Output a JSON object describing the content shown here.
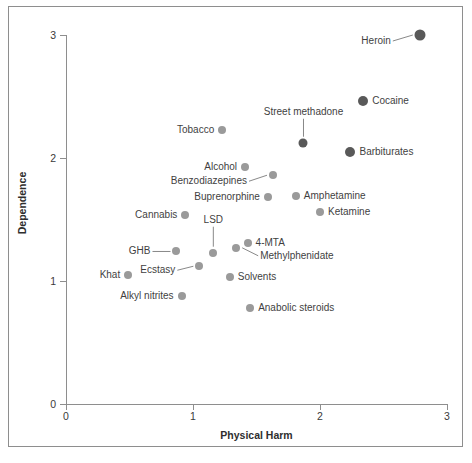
{
  "chart_data": {
    "type": "scatter",
    "title": "",
    "xlabel": "Physical Harm",
    "ylabel": "Dependence",
    "xlim": [
      0,
      3
    ],
    "ylim": [
      0,
      3
    ],
    "xticks": [
      0,
      1,
      2,
      3
    ],
    "yticks": [
      0,
      1,
      2,
      3
    ],
    "xtick_labels": [
      "0",
      "1",
      "2",
      "3"
    ],
    "ytick_labels": [
      "0",
      "1",
      "2",
      "3"
    ],
    "grid": false,
    "legend": "none",
    "colors": {
      "dark_marker": "#595959",
      "light_marker": "#9a9a9a",
      "axis": "#8e8e8e",
      "text": "#3f3f3f",
      "background": "#ffffff",
      "frame": "#8e8e8e"
    },
    "points": [
      {
        "label": "Heroin",
        "x": 2.79,
        "y": 3.0,
        "shade": "dark",
        "size": 11,
        "label_pos": "left",
        "leader": true
      },
      {
        "label": "Cocaine",
        "x": 2.34,
        "y": 2.46,
        "shade": "dark",
        "size": 10,
        "label_pos": "right",
        "leader": false
      },
      {
        "label": "Barbiturates",
        "x": 2.24,
        "y": 2.05,
        "shade": "dark",
        "size": 10,
        "label_pos": "right",
        "leader": false
      },
      {
        "label": "Street methadone",
        "x": 1.87,
        "y": 2.12,
        "shade": "dark",
        "size": 9,
        "label_pos": "above",
        "leader": true
      },
      {
        "label": "Tobacco",
        "x": 1.23,
        "y": 2.23,
        "shade": "light",
        "size": 8,
        "label_pos": "left",
        "leader": false
      },
      {
        "label": "Alcohol",
        "x": 1.41,
        "y": 1.93,
        "shade": "light",
        "size": 8,
        "label_pos": "left",
        "leader": false
      },
      {
        "label": "Benzodiazepines",
        "x": 1.63,
        "y": 1.86,
        "shade": "light",
        "size": 8,
        "label_pos": "left",
        "leader": true
      },
      {
        "label": "Buprenorphine",
        "x": 1.59,
        "y": 1.68,
        "shade": "light",
        "size": 8,
        "label_pos": "left",
        "leader": false
      },
      {
        "label": "Amphetamine",
        "x": 1.81,
        "y": 1.69,
        "shade": "light",
        "size": 8,
        "label_pos": "right",
        "leader": false
      },
      {
        "label": "Ketamine",
        "x": 2.0,
        "y": 1.56,
        "shade": "light",
        "size": 8,
        "label_pos": "right",
        "leader": false
      },
      {
        "label": "Cannabis",
        "x": 0.94,
        "y": 1.54,
        "shade": "light",
        "size": 8,
        "label_pos": "left",
        "leader": false
      },
      {
        "label": "LSD",
        "x": 1.16,
        "y": 1.23,
        "shade": "light",
        "size": 8,
        "label_pos": "above",
        "leader": true
      },
      {
        "label": "4-MTA",
        "x": 1.43,
        "y": 1.31,
        "shade": "light",
        "size": 8,
        "label_pos": "right",
        "leader": false
      },
      {
        "label": "Methylphenidate",
        "x": 1.34,
        "y": 1.27,
        "shade": "light",
        "size": 8,
        "label_pos": "right",
        "leader": true
      },
      {
        "label": "GHB",
        "x": 0.87,
        "y": 1.24,
        "shade": "light",
        "size": 8,
        "label_pos": "left",
        "leader": true
      },
      {
        "label": "Ecstasy",
        "x": 1.05,
        "y": 1.12,
        "shade": "light",
        "size": 8,
        "label_pos": "left",
        "leader": true
      },
      {
        "label": "Khat",
        "x": 0.49,
        "y": 1.05,
        "shade": "light",
        "size": 8,
        "label_pos": "left",
        "leader": false
      },
      {
        "label": "Solvents",
        "x": 1.29,
        "y": 1.03,
        "shade": "light",
        "size": 8,
        "label_pos": "right",
        "leader": false
      },
      {
        "label": "Alkyl nitrites",
        "x": 0.91,
        "y": 0.88,
        "shade": "light",
        "size": 8,
        "label_pos": "left",
        "leader": false
      },
      {
        "label": "Anabolic steroids",
        "x": 1.45,
        "y": 0.78,
        "shade": "light",
        "size": 8,
        "label_pos": "right",
        "leader": false
      }
    ]
  }
}
